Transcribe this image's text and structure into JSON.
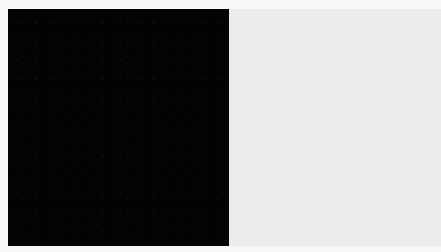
{
  "image": {
    "description": "Two adjacent flat color blocks: a black square on the left and a light gray rectangle on the right",
    "regions": [
      {
        "name": "dark-block",
        "color": "#030303"
      },
      {
        "name": "light-block",
        "color": "#ececec"
      }
    ],
    "background_color": "#f7f7f7"
  }
}
